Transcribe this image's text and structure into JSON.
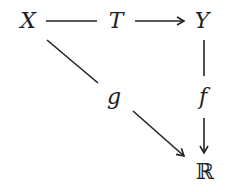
{
  "diagram": {
    "type": "commutative-diagram",
    "nodes": {
      "X": "X",
      "T": "T",
      "Y": "Y",
      "R": "ℝ"
    },
    "edge_labels": {
      "g": "g",
      "f": "f"
    },
    "edges": [
      {
        "from": "X",
        "to": "Y",
        "label": "T",
        "style": "arrow"
      },
      {
        "from": "Y",
        "to": "R",
        "label": "f",
        "style": "arrow"
      },
      {
        "from": "X",
        "to": "R",
        "label": "g",
        "style": "arrow"
      }
    ],
    "colors": {
      "stroke": "#222222",
      "background": "#ffffff"
    }
  }
}
